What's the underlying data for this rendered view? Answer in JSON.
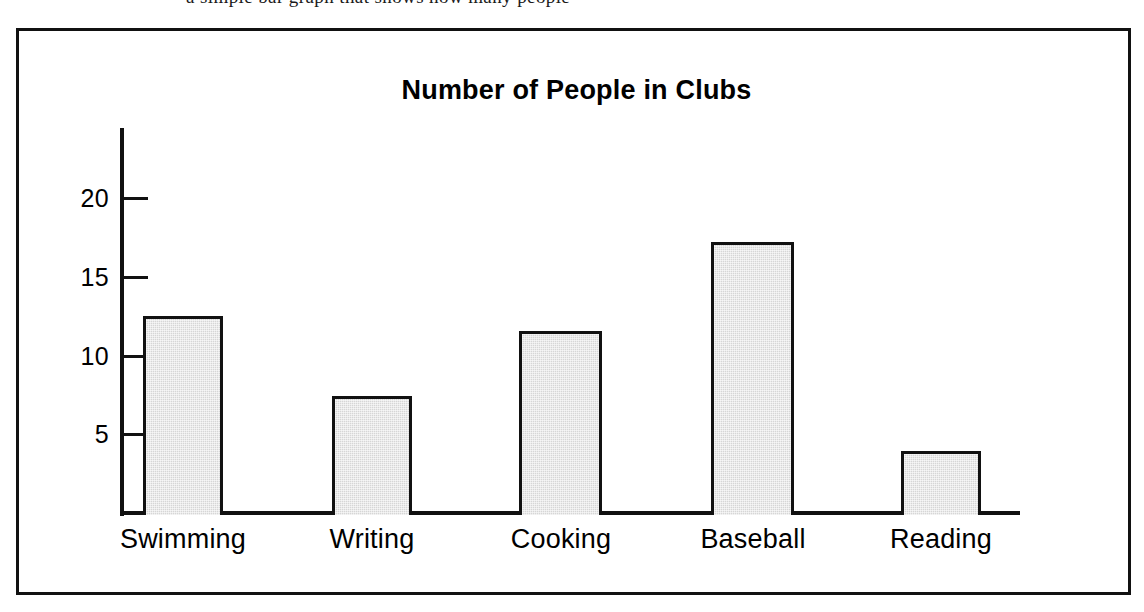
{
  "page": {
    "top_text_sliver": "a simple bar graph that shows how many people"
  },
  "figure": {
    "title": "Number of People in Clubs",
    "frame_color": "#111111",
    "bar_fill_color": "#d6d6d6",
    "bar_edge_color": "#111111",
    "background_color": "#ffffff"
  },
  "chart_data": {
    "type": "bar",
    "title": "Number of People in Clubs",
    "xlabel": "",
    "ylabel": "",
    "categories": [
      "Swimming",
      "Writing",
      "Cooking",
      "Baseball",
      "Reading"
    ],
    "values": [
      12.7,
      7.6,
      11.7,
      17.4,
      4.1
    ],
    "ylim": [
      0,
      23
    ],
    "yticks": [
      5,
      10,
      15,
      20
    ],
    "ytick_labels": [
      "5",
      "10",
      "15",
      "20"
    ],
    "grid": false,
    "legend": null,
    "tick_direction": "inward",
    "series": [
      {
        "name": "Number of People",
        "values": [
          12.7,
          7.6,
          11.7,
          17.4,
          4.1
        ]
      }
    ]
  }
}
